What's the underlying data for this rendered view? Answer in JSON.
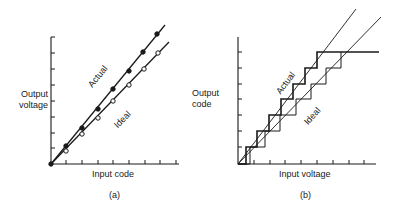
{
  "panel_a": {
    "caption": "(a)",
    "ylabel_line1": "Output",
    "ylabel_line2": "voltage",
    "xlabel": "Input code",
    "actual_label": "Actual",
    "ideal_label": "Ideal"
  },
  "panel_b": {
    "caption": "(b)",
    "ylabel_line1": "Output",
    "ylabel_line2": "code",
    "xlabel": "Input voltage",
    "actual_label": "Actual",
    "ideal_label": "Ideal"
  },
  "colors": {
    "ink": "#1a1a1a",
    "background": "#ffffff"
  }
}
